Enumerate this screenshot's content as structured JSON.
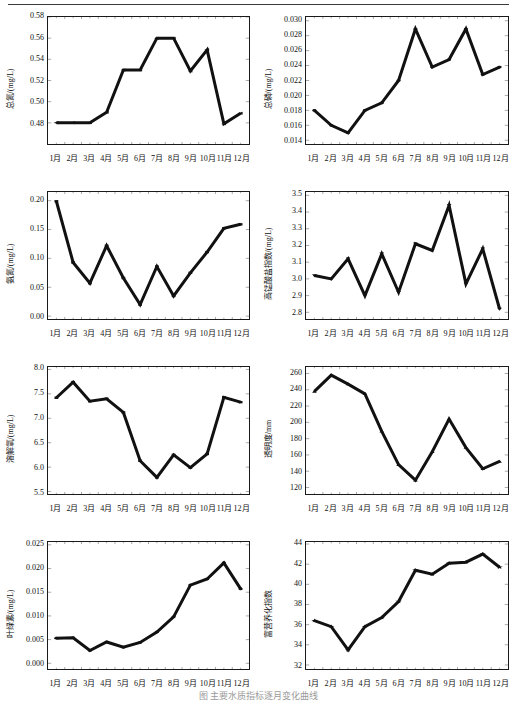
{
  "figure": {
    "caption": "图  主要水质指标逐月变化曲线",
    "months": [
      "1月",
      "2月",
      "3月",
      "4月",
      "5月",
      "6月",
      "7月",
      "8月",
      "9月",
      "10月",
      "11月",
      "12月"
    ]
  },
  "chart_data": [
    {
      "type": "line",
      "title": "",
      "ylabel": "总氮/(mg/L)",
      "xlabel": "",
      "categories": [
        "1月",
        "2月",
        "3月",
        "4月",
        "5月",
        "6月",
        "7月",
        "8月",
        "9月",
        "10月",
        "11月",
        "12月"
      ],
      "values": [
        0.48,
        0.48,
        0.48,
        0.49,
        0.53,
        0.53,
        0.56,
        0.56,
        0.529,
        0.549,
        0.479,
        0.489
      ],
      "ylim": [
        0.46,
        0.58
      ],
      "yticks": [
        0.48,
        0.5,
        0.52,
        0.54,
        0.56,
        0.58
      ],
      "ytick_labels": [
        "0.48",
        "0.50",
        "0.52",
        "0.54",
        "0.56",
        "0.58"
      ],
      "marker": "triangle-left",
      "grid": false,
      "legend": "none"
    },
    {
      "type": "line",
      "title": "",
      "ylabel": "总磷/(mg/L)",
      "xlabel": "",
      "categories": [
        "1月",
        "2月",
        "3月",
        "4月",
        "5月",
        "6月",
        "7月",
        "8月",
        "9月",
        "10月",
        "11月",
        "12月"
      ],
      "values": [
        0.018,
        0.016,
        0.015,
        0.018,
        0.019,
        0.022,
        0.0289,
        0.0238,
        0.0248,
        0.0289,
        0.0228,
        0.0238
      ],
      "ylim": [
        0.0135,
        0.0305
      ],
      "yticks": [
        0.014,
        0.016,
        0.018,
        0.02,
        0.022,
        0.024,
        0.026,
        0.028,
        0.03
      ],
      "ytick_labels": [
        "0.014",
        "0.016",
        "0.018",
        "0.020",
        "0.022",
        "0.024",
        "0.026",
        "0.028",
        "0.030"
      ],
      "marker": "circle",
      "grid": false,
      "legend": "none"
    },
    {
      "type": "line",
      "title": "",
      "ylabel": "氨氮/(mg/L)",
      "xlabel": "",
      "categories": [
        "1月",
        "2月",
        "3月",
        "4月",
        "5月",
        "6月",
        "7月",
        "8月",
        "9月",
        "10月",
        "11月",
        "12月"
      ],
      "values": [
        0.199,
        0.093,
        0.057,
        0.122,
        0.066,
        0.02,
        0.086,
        0.035,
        0.075,
        0.111,
        0.152,
        0.159
      ],
      "ylim": [
        -0.005,
        0.215
      ],
      "yticks": [
        0.0,
        0.05,
        0.1,
        0.15,
        0.2
      ],
      "ytick_labels": [
        "0.00",
        "0.05",
        "0.10",
        "0.15",
        "0.20"
      ],
      "marker": "square",
      "grid": false,
      "legend": "none"
    },
    {
      "type": "line",
      "title": "",
      "ylabel": "高锰酸盐指数/(mg/L)",
      "xlabel": "",
      "categories": [
        "1月",
        "2月",
        "3月",
        "4月",
        "5月",
        "6月",
        "7月",
        "8月",
        "9月",
        "10月",
        "11月",
        "12月"
      ],
      "values": [
        3.02,
        3.0,
        3.12,
        2.9,
        3.15,
        2.92,
        3.21,
        3.17,
        3.44,
        2.97,
        3.18,
        2.82
      ],
      "ylim": [
        2.76,
        3.52
      ],
      "yticks": [
        2.8,
        2.9,
        3.0,
        3.1,
        3.2,
        3.3,
        3.4,
        3.5
      ],
      "ytick_labels": [
        "2.8",
        "2.9",
        "3.0",
        "3.1",
        "3.2",
        "3.3",
        "3.4",
        "3.5"
      ],
      "marker": "triangle-down",
      "grid": false,
      "legend": "none"
    },
    {
      "type": "line",
      "title": "",
      "ylabel": "溶解氧/(mg/L)",
      "xlabel": "",
      "categories": [
        "1月",
        "2月",
        "3月",
        "4月",
        "5月",
        "6月",
        "7月",
        "8月",
        "9月",
        "10月",
        "11月",
        "12月"
      ],
      "values": [
        7.42,
        7.74,
        7.35,
        7.4,
        7.12,
        6.13,
        5.79,
        6.25,
        5.99,
        6.27,
        7.43,
        7.33
      ],
      "ylim": [
        5.45,
        8.05
      ],
      "yticks": [
        5.5,
        6.0,
        6.5,
        7.0,
        7.5,
        8.0
      ],
      "ytick_labels": [
        "5.5",
        "6.0",
        "6.5",
        "7.0",
        "7.5",
        "8.0"
      ],
      "marker": "square",
      "grid": false,
      "legend": "none"
    },
    {
      "type": "line",
      "title": "",
      "ylabel": "透明度/mm",
      "xlabel": "",
      "categories": [
        "1月",
        "2月",
        "3月",
        "4月",
        "5月",
        "6月",
        "7月",
        "8月",
        "9月",
        "10月",
        "11月",
        "12月"
      ],
      "values": [
        238,
        258,
        247,
        235,
        189,
        148,
        129,
        164,
        204,
        169,
        143,
        152
      ],
      "ylim": [
        112,
        268
      ],
      "yticks": [
        120,
        140,
        160,
        180,
        200,
        220,
        240,
        260
      ],
      "ytick_labels": [
        "120",
        "140",
        "160",
        "180",
        "200",
        "220",
        "240",
        "260"
      ],
      "marker": "triangle-up",
      "grid": false,
      "legend": "none"
    },
    {
      "type": "line",
      "title": "",
      "ylabel": "叶绿素/(mg/L)",
      "xlabel": "",
      "categories": [
        "1月",
        "2月",
        "3月",
        "4月",
        "5月",
        "6月",
        "7月",
        "8月",
        "9月",
        "10月",
        "11月",
        "12月"
      ],
      "values": [
        0.0053,
        0.0054,
        0.0027,
        0.0045,
        0.0034,
        0.0044,
        0.0066,
        0.0098,
        0.0165,
        0.0178,
        0.0212,
        0.0157
      ],
      "ylim": [
        -0.0012,
        0.0256
      ],
      "yticks": [
        0.0,
        0.005,
        0.01,
        0.015,
        0.02,
        0.025
      ],
      "ytick_labels": [
        "0.000",
        "0.005",
        "0.010",
        "0.015",
        "0.020",
        "0.025"
      ],
      "marker": "circle",
      "grid": false,
      "legend": "none"
    },
    {
      "type": "line",
      "title": "",
      "ylabel": "富营养化指数",
      "xlabel": "",
      "categories": [
        "1月",
        "2月",
        "3月",
        "4月",
        "5月",
        "6月",
        "7月",
        "8月",
        "9月",
        "10月",
        "11月",
        "12月"
      ],
      "values": [
        36.4,
        35.8,
        33.5,
        35.8,
        36.7,
        38.3,
        41.4,
        41.0,
        42.1,
        42.2,
        43.0,
        41.7
      ],
      "ylim": [
        31.6,
        44.2
      ],
      "yticks": [
        32,
        34,
        36,
        38,
        40,
        42,
        44
      ],
      "ytick_labels": [
        "32",
        "34",
        "36",
        "38",
        "40",
        "42",
        "44"
      ],
      "marker": "star",
      "grid": false,
      "legend": "none"
    }
  ]
}
